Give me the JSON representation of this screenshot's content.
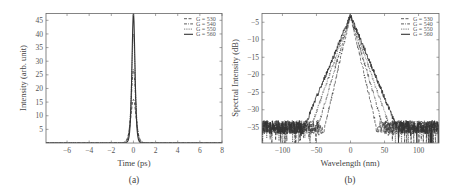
{
  "chart_data": [
    {
      "id": "a",
      "type": "line",
      "panel_label": "(a)",
      "title": "",
      "xlabel": "Time (ps)",
      "ylabel": "Intensity (arb. unit)",
      "xlim": [
        -7.9,
        8
      ],
      "ylim": [
        0,
        47.5
      ],
      "xticks": [
        -6,
        -4,
        -2,
        0,
        2,
        4,
        6,
        8
      ],
      "yticks": [
        5,
        10,
        15,
        20,
        25,
        30,
        35,
        40,
        45
      ],
      "grid": false,
      "legend_position": "upper right",
      "series": [
        {
          "name": "G = 530",
          "style": "dashed",
          "peak": 16,
          "fwhm_ps": 0.55
        },
        {
          "name": "G = 540",
          "style": "dashdot",
          "peak": 27,
          "fwhm_ps": 0.45
        },
        {
          "name": "G = 550",
          "style": "dotted",
          "peak": 40,
          "fwhm_ps": 0.38
        },
        {
          "name": "G = 560",
          "style": "solid",
          "peak": 48,
          "fwhm_ps": 0.32
        }
      ],
      "x": [
        -7.9,
        -2,
        -1.5,
        -1,
        -0.75,
        -0.5,
        -0.25,
        0,
        0.25,
        0.5,
        0.75,
        1,
        1.5,
        2,
        8
      ]
    },
    {
      "id": "b",
      "type": "line",
      "panel_label": "(b)",
      "title": "",
      "xlabel": "Wavelength (nm)",
      "ylabel": "Spectral Intensity (dB)",
      "xlim": [
        -130,
        130
      ],
      "ylim": [
        -39.5,
        -2.5
      ],
      "xticks": [
        -100,
        -50,
        0,
        50,
        100
      ],
      "yticks": [
        -5,
        -10,
        -15,
        -20,
        -25,
        -30,
        -35
      ],
      "grid": false,
      "legend_position": "upper right",
      "series": [
        {
          "name": "G = 530",
          "style": "dashed",
          "peak_db": -3,
          "floor_db": -35,
          "edge_nm": 38
        },
        {
          "name": "G = 540",
          "style": "dashdot",
          "peak_db": -3,
          "floor_db": -35,
          "edge_nm": 48
        },
        {
          "name": "G = 550",
          "style": "dotted",
          "peak_db": -3,
          "floor_db": -35,
          "edge_nm": 58
        },
        {
          "name": "G = 560",
          "style": "solid",
          "peak_db": -3,
          "floor_db": -35,
          "edge_nm": 68
        }
      ]
    }
  ],
  "legend": {
    "entries": [
      "G = 530",
      "G = 540",
      "G = 550",
      "G = 560"
    ]
  },
  "labels": {
    "a_xlabel": "Time (ps)",
    "a_ylabel": "Intensity (arb. unit)",
    "a_panel": "(a)",
    "b_xlabel": "Wavelength (nm)",
    "b_ylabel": "Spectral Intensity (dB)",
    "b_panel": "(b)"
  }
}
